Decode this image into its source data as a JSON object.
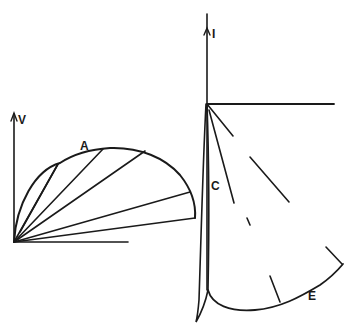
{
  "diagram": {
    "left_panel": {
      "axis_label_vertical": "V",
      "curve_label": "A",
      "description": "Semicircular curve from origin with chords drawn from origin to points on the arc"
    },
    "right_panel": {
      "axis_label_vertical": "I",
      "curve_labels": [
        "C",
        "E"
      ],
      "description": "Narrow loop along vertical axis (C) and sweeping curve (E) with radial line segments from origin"
    },
    "colors": {
      "ink": "#1a1a1a",
      "background": "#ffffff"
    }
  }
}
